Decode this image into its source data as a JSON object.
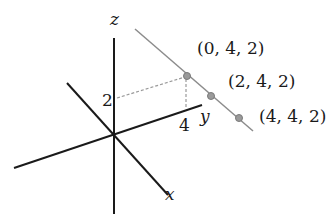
{
  "diagram": {
    "type": "3d-coordinate-axes-with-line",
    "axes": {
      "x": {
        "label": "x"
      },
      "y": {
        "label": "y"
      },
      "z": {
        "label": "z"
      }
    },
    "tick_labels": {
      "z_tick": "2",
      "y_tick": "4"
    },
    "points": [
      {
        "label": "(0, 4, 2)",
        "coords": [
          0,
          4,
          2
        ]
      },
      {
        "label": "(2, 4, 2)",
        "coords": [
          2,
          4,
          2
        ]
      },
      {
        "label": "(4, 4, 2)",
        "coords": [
          4,
          4,
          2
        ]
      }
    ],
    "colors": {
      "axis": "#1a1a1a",
      "line": "#8c8c8c",
      "point": "#8c8c8c",
      "dashed_guide": "#9a9a9a"
    }
  }
}
